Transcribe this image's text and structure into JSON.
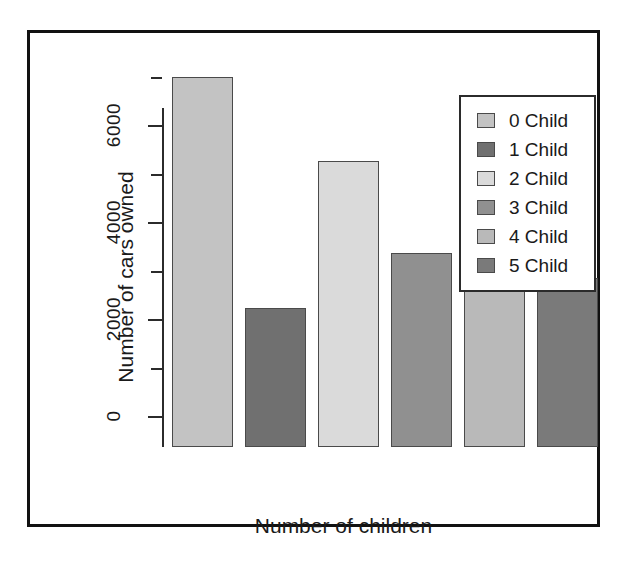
{
  "chart_data": {
    "type": "bar",
    "title": "",
    "xlabel": "Number of children",
    "ylabel": "Number of cars owned",
    "categories": [
      "0 Child",
      "1 Child",
      "2 Child",
      "3 Child",
      "4 Child",
      "5 Child"
    ],
    "values": [
      7640,
      2880,
      5900,
      4000,
      3500,
      3500
    ],
    "ylim": [
      0,
      7700
    ],
    "yticks_major": [
      0,
      2000,
      4000,
      6000
    ],
    "ytick_labels": [
      "0",
      "2000",
      "4000",
      "6000"
    ],
    "yticks_minor": [
      1000,
      3000,
      5000,
      7000
    ],
    "grid": false,
    "legend_position": "top-right",
    "bar_colors": [
      "#c3c3c3",
      "#707070",
      "#dadada",
      "#909090",
      "#b9b9b9",
      "#7a7a7a"
    ],
    "bar_border_color": "#4a4a4a"
  },
  "legend": {
    "items": [
      {
        "label": "0 Child",
        "color": "#c3c3c3"
      },
      {
        "label": "1 Child",
        "color": "#707070"
      },
      {
        "label": "2 Child",
        "color": "#dadada"
      },
      {
        "label": "3 Child",
        "color": "#909090"
      },
      {
        "label": "4 Child",
        "color": "#b9b9b9"
      },
      {
        "label": "5 Child",
        "color": "#7a7a7a"
      }
    ]
  },
  "axes": {
    "y_title": "Number of cars owned",
    "x_title": "Number of children",
    "y_tick_labels": [
      "0",
      "2000",
      "4000",
      "6000"
    ],
    "axis_color": "#2b2b2b"
  },
  "frame": {
    "border_color": "#111111",
    "background": "#ffffff"
  }
}
